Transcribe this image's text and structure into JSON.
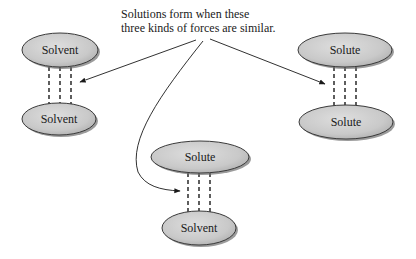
{
  "caption": {
    "line1": "Solutions form when these",
    "line2": "three kinds of forces are similar."
  },
  "colors": {
    "ellipse_fill": "#cdcdcd",
    "ellipse_stroke": "#3a3a3a",
    "shadow": "#6b6b6b",
    "line": "#1a1a1a"
  },
  "pairs": [
    {
      "name": "solvent-solvent",
      "top": "Solvent",
      "bottom": "Solvent"
    },
    {
      "name": "solute-solute",
      "top": "Solute",
      "bottom": "Solute"
    },
    {
      "name": "solute-solvent",
      "top": "Solute",
      "bottom": "Solvent"
    }
  ]
}
